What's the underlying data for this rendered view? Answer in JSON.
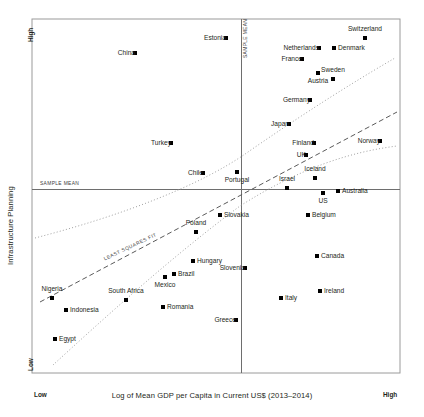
{
  "axes": {
    "x_title": "Log of Mean GDP per Capita in Current US$ (2013–2014)",
    "y_title": "Infrastructure Planning",
    "x_low_label": "Low",
    "x_high_label": "High",
    "y_low_label": "Low",
    "y_high_label": "High"
  },
  "annotations": {
    "mean_horizontal": "SAMPLE MEAN",
    "mean_vertical": "SAMPLE MEAN",
    "least_squares_fit": "LEAST SQUARES FIT"
  },
  "colors": {
    "point": "#000000",
    "text": "#231f20",
    "frame": "#8c8c8c",
    "mean_line": "#6e6e6e",
    "fit_line": "#5a5a5a",
    "band_line": "#9a9a9a"
  },
  "chart_data": {
    "type": "scatter",
    "title": "",
    "xlabel": "Log of Mean GDP per Capita in Current US$ (2013–2014)",
    "ylabel": "Infrastructure Planning",
    "xlim": [
      0,
      1
    ],
    "ylim": [
      0,
      1
    ],
    "grid": false,
    "legend": null,
    "x_ticks": [
      "Low",
      "High"
    ],
    "y_ticks": [
      "Low",
      "High"
    ],
    "reference_lines": [
      {
        "name": "sample-mean-vertical",
        "orientation": "vertical",
        "label": "SAMPLE MEAN",
        "x": 0.568
      },
      {
        "name": "sample-mean-horizontal",
        "orientation": "horizontal",
        "label": "SAMPLE MEAN",
        "y": 0.519
      },
      {
        "name": "least-squares-fit",
        "orientation": "diagonal",
        "label": "LEAST SQUARES FIT",
        "style": "dashed"
      },
      {
        "name": "confidence-band-upper",
        "orientation": "diagonal",
        "style": "dotted"
      },
      {
        "name": "confidence-band-lower",
        "orientation": "diagonal",
        "style": "dotted"
      }
    ],
    "points": [
      {
        "label": "Switzerland",
        "px": 365,
        "py": 38,
        "lx": 365,
        "ly": 38,
        "pos": "above",
        "quadrant": "high-high"
      },
      {
        "label": "Estonia",
        "px": 226,
        "py": 38,
        "lx": 226,
        "ly": 38,
        "pos": "left",
        "quadrant": "low-high"
      },
      {
        "label": "Netherlands",
        "px": 319,
        "py": 48,
        "lx": 319,
        "ly": 48,
        "pos": "left",
        "quadrant": "high-high"
      },
      {
        "label": "Denmark",
        "px": 334,
        "py": 48,
        "lx": 334,
        "ly": 48,
        "pos": "right",
        "quadrant": "high-high"
      },
      {
        "label": "China",
        "px": 135,
        "py": 53,
        "lx": 135,
        "ly": 53,
        "pos": "left",
        "quadrant": "low-high"
      },
      {
        "label": "France",
        "px": 302,
        "py": 59,
        "lx": 302,
        "ly": 59,
        "pos": "left",
        "quadrant": "high-high"
      },
      {
        "label": "Sweden",
        "px": 333,
        "py": 79,
        "lx": 333,
        "ly": 79,
        "pos": "above",
        "quadrant": "high-high"
      },
      {
        "label": "Austria",
        "px": 318,
        "py": 73,
        "lx": 318,
        "ly": 73,
        "pos": "below",
        "quadrant": "high-high"
      },
      {
        "label": "Germany",
        "px": 310,
        "py": 100,
        "lx": 310,
        "ly": 100,
        "pos": "left",
        "quadrant": "high-high"
      },
      {
        "label": "Japan",
        "px": 289,
        "py": 124,
        "lx": 289,
        "ly": 124,
        "pos": "left",
        "quadrant": "high-high"
      },
      {
        "label": "Finland",
        "px": 314,
        "py": 143,
        "lx": 314,
        "ly": 143,
        "pos": "left",
        "quadrant": "high-high"
      },
      {
        "label": "Norway",
        "px": 380,
        "py": 141,
        "lx": 380,
        "ly": 141,
        "pos": "left",
        "quadrant": "high-high"
      },
      {
        "label": "Turkey",
        "px": 171,
        "py": 143,
        "lx": 171,
        "ly": 143,
        "pos": "left",
        "quadrant": "low-high"
      },
      {
        "label": "UK",
        "px": 306,
        "py": 155,
        "lx": 306,
        "ly": 155,
        "pos": "left",
        "quadrant": "high-high"
      },
      {
        "label": "Iceland",
        "px": 315,
        "py": 178,
        "lx": 315,
        "ly": 178,
        "pos": "above",
        "quadrant": "high-high"
      },
      {
        "label": "Chile",
        "px": 203,
        "py": 173,
        "lx": 203,
        "ly": 173,
        "pos": "left",
        "quadrant": "low-high"
      },
      {
        "label": "Portugal",
        "px": 237,
        "py": 172,
        "lx": 237,
        "ly": 172,
        "pos": "below",
        "quadrant": "low-high"
      },
      {
        "label": "Israel",
        "px": 287,
        "py": 188,
        "lx": 287,
        "ly": 188,
        "pos": "above",
        "quadrant": "high-high"
      },
      {
        "label": "Australia",
        "px": 338,
        "py": 191,
        "lx": 338,
        "ly": 191,
        "pos": "right",
        "quadrant": "high-low"
      },
      {
        "label": "US",
        "px": 323,
        "py": 193,
        "lx": 323,
        "ly": 193,
        "pos": "below",
        "quadrant": "high-low"
      },
      {
        "label": "Belgium",
        "px": 308,
        "py": 215,
        "lx": 308,
        "ly": 215,
        "pos": "right",
        "quadrant": "high-low"
      },
      {
        "label": "Slovakia",
        "px": 220,
        "py": 215,
        "lx": 220,
        "ly": 215,
        "pos": "right",
        "quadrant": "low-low"
      },
      {
        "label": "Poland",
        "px": 196,
        "py": 232,
        "lx": 196,
        "ly": 232,
        "pos": "above",
        "quadrant": "low-low"
      },
      {
        "label": "Canada",
        "px": 317,
        "py": 256,
        "lx": 317,
        "ly": 256,
        "pos": "right",
        "quadrant": "high-low"
      },
      {
        "label": "Hungary",
        "px": 193,
        "py": 261,
        "lx": 193,
        "ly": 261,
        "pos": "right",
        "quadrant": "low-low"
      },
      {
        "label": "Slovenia",
        "px": 245,
        "py": 268,
        "lx": 245,
        "ly": 268,
        "pos": "left",
        "quadrant": "low-low"
      },
      {
        "label": "Brazil",
        "px": 174,
        "py": 274,
        "lx": 174,
        "ly": 274,
        "pos": "right",
        "quadrant": "low-low"
      },
      {
        "label": "Mexico",
        "px": 165,
        "py": 277,
        "lx": 165,
        "ly": 277,
        "pos": "below",
        "quadrant": "low-low"
      },
      {
        "label": "Ireland",
        "px": 320,
        "py": 291,
        "lx": 320,
        "ly": 291,
        "pos": "right",
        "quadrant": "high-low"
      },
      {
        "label": "Italy",
        "px": 281,
        "py": 298,
        "lx": 281,
        "ly": 298,
        "pos": "right",
        "quadrant": "high-low"
      },
      {
        "label": "Nigeria",
        "px": 52,
        "py": 298,
        "lx": 52,
        "ly": 298,
        "pos": "above",
        "quadrant": "low-low"
      },
      {
        "label": "South Africa",
        "px": 126,
        "py": 300,
        "lx": 126,
        "ly": 300,
        "pos": "above",
        "quadrant": "low-low"
      },
      {
        "label": "Indonesia",
        "px": 66,
        "py": 310,
        "lx": 66,
        "ly": 310,
        "pos": "right",
        "quadrant": "low-low"
      },
      {
        "label": "Romania",
        "px": 163,
        "py": 307,
        "lx": 163,
        "ly": 307,
        "pos": "right",
        "quadrant": "low-low"
      },
      {
        "label": "Greece",
        "px": 236,
        "py": 320,
        "lx": 236,
        "ly": 320,
        "pos": "left",
        "quadrant": "low-low"
      },
      {
        "label": "Egypt",
        "px": 55,
        "py": 339,
        "lx": 55,
        "ly": 339,
        "pos": "right",
        "quadrant": "low-low"
      }
    ]
  }
}
